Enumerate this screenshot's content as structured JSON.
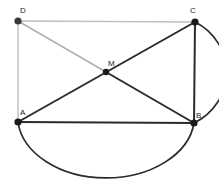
{
  "figure": {
    "width": 219,
    "height": 190,
    "background_color": "#ffffff",
    "colors": {
      "dark_stroke": "#2b2b2b",
      "light_stroke": "#bfbfbf",
      "vertex_fill": "#1a1a1a",
      "label_color": "#1a1a1a"
    }
  },
  "points": {
    "D": {
      "label": "D",
      "x": 18,
      "y": 21,
      "label_x": 20,
      "label_y": 13
    },
    "C": {
      "label": "C",
      "x": 195,
      "y": 22,
      "label_x": 190,
      "label_y": 13
    },
    "A": {
      "label": "A",
      "x": 18,
      "y": 122,
      "label_x": 20,
      "label_y": 115
    },
    "B": {
      "label": "B",
      "x": 194,
      "y": 123,
      "label_x": 196,
      "label_y": 118
    },
    "M": {
      "label": "M",
      "x": 106,
      "y": 72,
      "label_x": 108,
      "label_y": 66
    }
  },
  "segments": [
    {
      "name": "segment-DC",
      "from": "D",
      "to": "C",
      "shade": "light"
    },
    {
      "name": "segment-DA",
      "from": "D",
      "to": "A",
      "shade": "light"
    },
    {
      "name": "segment-DM",
      "from": "D",
      "to": "M",
      "shade": "light"
    },
    {
      "name": "segment-MB",
      "from": "M",
      "to": "B",
      "shade": "dark"
    },
    {
      "name": "segment-AC",
      "from": "A",
      "to": "C",
      "shade": "dark"
    },
    {
      "name": "segment-AB",
      "from": "A",
      "to": "B",
      "shade": "dark"
    },
    {
      "name": "segment-CB",
      "from": "C",
      "to": "B",
      "shade": "dark"
    }
  ],
  "arcs": [
    {
      "name": "arc-AB-semicircle",
      "from": "A",
      "to": "B",
      "bulge": "down",
      "shade": "dark"
    },
    {
      "name": "arc-CB",
      "from": "C",
      "to": "B",
      "bulge": "right",
      "shade": "dark"
    }
  ],
  "vertex_dot_radius": 3.6
}
